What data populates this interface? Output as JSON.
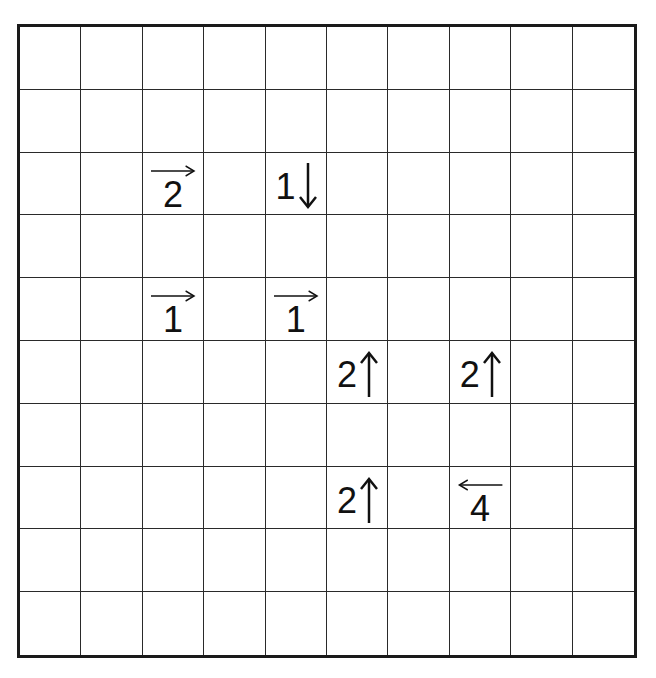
{
  "puzzle": {
    "type": "arrow-clue grid",
    "rows": 10,
    "cols": 10,
    "clues": [
      {
        "row": 2,
        "col": 2,
        "number": "2",
        "direction": "right",
        "icon": "arrow-right-icon"
      },
      {
        "row": 2,
        "col": 4,
        "number": "1",
        "direction": "down",
        "icon": "arrow-down-icon"
      },
      {
        "row": 4,
        "col": 2,
        "number": "1",
        "direction": "right",
        "icon": "arrow-right-icon"
      },
      {
        "row": 4,
        "col": 4,
        "number": "1",
        "direction": "right",
        "icon": "arrow-right-icon"
      },
      {
        "row": 5,
        "col": 5,
        "number": "2",
        "direction": "up",
        "icon": "arrow-up-icon"
      },
      {
        "row": 5,
        "col": 7,
        "number": "2",
        "direction": "up",
        "icon": "arrow-up-icon"
      },
      {
        "row": 7,
        "col": 5,
        "number": "2",
        "direction": "up",
        "icon": "arrow-up-icon"
      },
      {
        "row": 7,
        "col": 7,
        "number": "4",
        "direction": "left",
        "icon": "arrow-left-icon"
      }
    ]
  },
  "colors": {
    "grid_line": "#2a2a2a",
    "border": "#1a1a1a",
    "ink": "#111111",
    "background": "#ffffff"
  }
}
